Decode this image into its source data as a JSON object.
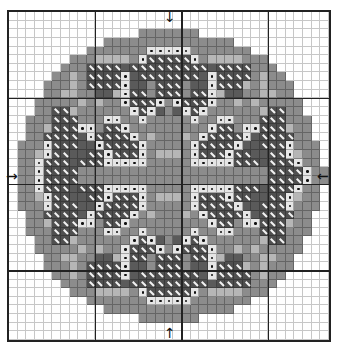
{
  "chart": {
    "cols": 37,
    "rows": 38,
    "bold_every": 10,
    "symbol_key": {
      ".": "empty",
      "M": "medium-gray-fill",
      "L": "light-gray-fill",
      "D": "dark-gray-fill",
      "S": "dark-slash-symbol",
      "W": "white-dot-symbol"
    },
    "colors": {
      "grid_line": "#222222",
      "medium": "#8c8c8c",
      "light": "#b6b6b6",
      "dark": "#5a5a5a",
      "slash": "#4f4f4f",
      "dot_cell": "#e6e6e6"
    },
    "center_arrows": {
      "top": "↓",
      "bottom": "↑",
      "left": "→",
      "right": "←"
    },
    "grid": [
      ".....................................",
      ".....................................",
      "...............MMMMMMM...............",
      "...........MMMMMMMMMMMMMMM...........",
      ".........MMMMMMMWWWWWMMMMMMM.........",
      ".......MMMLLLLMWSSSSSWMLLLLMMM.......",
      "......MMMSSSSDSSSSSSSSSDSSSSMMM......",
      ".....MMLMSSSSWDSSSSSSSDWSSSSMLMM.....",
      "....MMMLMSSSSWDDMSSSMDDWSSSLMLMMM....",
      "....MMLLMMDDLWSSMSSSMSSWLDDMMLLMM....",
      "...MMMMMLMLMMWSSSWMWSSSWMMLMLMMMMM...",
      "...MMSSLMMMMMMWSWDMDWSWMMMMMMLSSMM...",
      "..MMMSSSMMMWWMMWMMMMMWMMWWMMMSSSMMM..",
      "..MMLSSSWWMSSWMMMMMMMMMWSSMWWSSSLMM..",
      "..MMSSSSDWSSSSWMLMMMLMWSSSSWDSSSSMM..",
      ".MMMWSSSDDWSSSSWMMMMMWSSSSWDDSSSWMMM.",
      ".MMLWSSDDSSWSSSWMLLLMWSSSWSSDDSSWLMM.",
      ".MMWSSSDSSSWWWWWMMMMMWWWWWSSSDSSSWMM.",
      ".MMWSSSSMMMMMMMMMMMMMMMMMMMMMMSSSSWMM.",
      ".MMWSSSSMMMMMMMMMMMMMMMMMMMMMMSSSSWMM.",
      ".MMWSSSDSSSWWWWWMMMMMWWWWWSSSDSSSWMM.",
      ".MMLWSSDDSSWSSSWMLLLMWSSSWSSDDSSWLMM.",
      ".MMMWSSSDDWSSSSWMMMMMWSSSSWDDSSSWMMM.",
      "..MMSSSSDWSSSSWMLMMMLMWSSSSWDSSSSMM..",
      "..MMLSSSWWMSSWMMMMMMMMMWSSMWWSSSLMM..",
      "..MMMSSSMMMWWMMWMMMMMWMMWWMMMSSSMMM..",
      "...MMSSLMMMMMMWSWDMDWSWMMMMMMLSSMM...",
      "...MMMMMLMLMMWSSSWMWSSSWMMLMLMMMMM...",
      "....MMLLMMDDLWSSMSSSMSSWLDDMMLLMM....",
      "....MMMLMSSSSWDDMSSSMDDWSSSLMLMMM....",
      ".....MMLMSSSSWDSSSSSSSDWSSSSMLMM.....",
      "......MMMSSSSDSSSSSSSSSDSSSSMMM......",
      ".......MMMLLLLMWSSSSSWMLLLLMMM.......",
      ".........MMMMMMMWWWWWMMMMMMM.........",
      "...........MMMMMMMMMMMMMMM...........",
      "...............MMMMMMM...............",
      ".....................................",
      "....................................."
    ]
  }
}
